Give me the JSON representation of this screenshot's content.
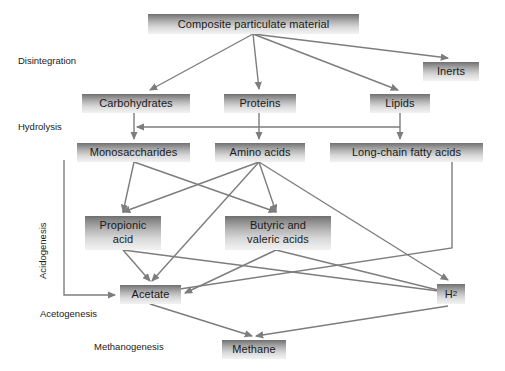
{
  "diagram": {
    "colors": {
      "node_fill_dark": "#6f6f6f",
      "node_fill_light": "#f2f2f2",
      "edge": "#7d7d7d",
      "text": "#1a1a1a",
      "background": "#ffffff"
    },
    "nodes": [
      {
        "id": "composite",
        "label": "Composite particulate material",
        "x": 148,
        "y": 14,
        "w": 211,
        "h": 20
      },
      {
        "id": "inerts",
        "label": "Inerts",
        "x": 423,
        "y": 62,
        "w": 56,
        "h": 19
      },
      {
        "id": "carbs",
        "label": "Carbohydrates",
        "x": 82,
        "y": 94,
        "w": 108,
        "h": 19
      },
      {
        "id": "proteins",
        "label": "Proteins",
        "x": 224,
        "y": 94,
        "w": 72,
        "h": 19
      },
      {
        "id": "lipids",
        "label": "Lipids",
        "x": 370,
        "y": 94,
        "w": 60,
        "h": 19
      },
      {
        "id": "monosacch",
        "label": "Monosaccharides",
        "x": 77,
        "y": 143,
        "w": 113,
        "h": 19
      },
      {
        "id": "aminoacids",
        "label": "Amino acids",
        "x": 215,
        "y": 143,
        "w": 90,
        "h": 19
      },
      {
        "id": "lcfa",
        "label": "Long-chain fatty acids",
        "x": 330,
        "y": 143,
        "w": 153,
        "h": 19
      },
      {
        "id": "propionic",
        "label": "Propionic\nacid",
        "x": 85,
        "y": 216,
        "w": 76,
        "h": 34
      },
      {
        "id": "butyric",
        "label": "Butyric and\nvaleric acids",
        "x": 225,
        "y": 216,
        "w": 106,
        "h": 34
      },
      {
        "id": "acetate",
        "label": "Acetate",
        "x": 120,
        "y": 285,
        "w": 61,
        "h": 19
      },
      {
        "id": "hydrogen",
        "label": "H",
        "sublabel": "2",
        "x": 437,
        "y": 284,
        "w": 28,
        "h": 20
      },
      {
        "id": "methane",
        "label": "Methane",
        "x": 222,
        "y": 340,
        "w": 64,
        "h": 19
      }
    ],
    "stage_labels": [
      {
        "id": "disintegration",
        "label": "Disintegration",
        "x": 18,
        "y": 55,
        "rotated": false
      },
      {
        "id": "hydrolysis",
        "label": "Hydrolysis",
        "x": 18,
        "y": 121,
        "rotated": false
      },
      {
        "id": "acidogenesis",
        "label": "Acidogenesis",
        "x": 48,
        "y": 268,
        "rotated": true
      },
      {
        "id": "acetogenesis",
        "label": "Acetogenesis",
        "x": 40,
        "y": 308,
        "rotated": false
      },
      {
        "id": "methanogenesis",
        "label": "Methanogenesis",
        "x": 94,
        "y": 341,
        "rotated": false
      }
    ],
    "edges": [
      {
        "from": "composite",
        "to": "carbs",
        "d": "M 253 34 L 150 90"
      },
      {
        "from": "composite",
        "to": "proteins",
        "d": "M 253 34 L 259 89"
      },
      {
        "from": "composite",
        "to": "lipids",
        "d": "M 253 34 L 398 90"
      },
      {
        "from": "composite",
        "to": "inerts",
        "d": "M 253 34 L 448 58"
      },
      {
        "from": "carbs",
        "to": "monosacch",
        "d": "M 134 113 L 134 139"
      },
      {
        "from": "proteins",
        "to": "aminoacids",
        "d": "M 259 113 L 259 139"
      },
      {
        "from": "lipids",
        "to": "lcfa",
        "d": "M 400 113 L 400 139"
      },
      {
        "from": "lcfa-bracket",
        "to": "monosacch-bracket",
        "d": "M 400 127 L 137 127"
      },
      {
        "from": "monosacch",
        "to": "propionic",
        "d": "M 134 162 L 123 212"
      },
      {
        "from": "monosacch",
        "to": "butyric",
        "d": "M 134 162 L 276 212"
      },
      {
        "from": "aminoacids",
        "to": "propionic",
        "d": "M 259 162 L 123 212"
      },
      {
        "from": "aminoacids",
        "to": "butyric",
        "d": "M 259 162 L 276 212"
      },
      {
        "from": "aminoacids",
        "to": "acetate",
        "d": "M 259 162 L 152 281"
      },
      {
        "from": "aminoacids",
        "to": "hydrogen",
        "d": "M 259 162 L 448 280"
      },
      {
        "from": "lcfa",
        "to": "acetate",
        "d": "M 452 162 L 452 248 L 160 292"
      },
      {
        "from": "propionic",
        "to": "acetate",
        "d": "M 123 250 L 150 281"
      },
      {
        "from": "propionic",
        "to": "hydrogen",
        "d": "M 123 250 L 446 292"
      },
      {
        "from": "butyric",
        "to": "acetate",
        "d": "M 276 250 L 185 293"
      },
      {
        "from": "butyric",
        "to": "hydrogen",
        "d": "M 276 250 L 446 292"
      },
      {
        "from": "acetate",
        "to": "methane",
        "d": "M 150 304 L 252 336"
      },
      {
        "from": "hydrogen",
        "to": "methane",
        "d": "M 448 306 L 256 336"
      },
      {
        "from": "acidogenesis-bracket",
        "to": "acetate",
        "d": "M 64 160 L 64 295 L 115 295"
      }
    ]
  }
}
